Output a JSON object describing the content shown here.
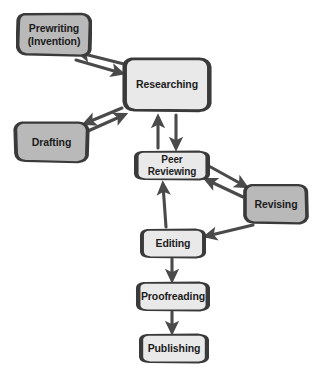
{
  "diagram": {
    "style": "hand-drawn flowchart",
    "colors": {
      "background": "#ffffff",
      "node_fill_dark": "#b9b9b9",
      "node_fill_light": "#e9e9e9",
      "node_stroke": "#3a3a3a",
      "edge_stroke": "#4a4a4a",
      "text": "#1c1c1c"
    },
    "nodes": [
      {
        "id": "prewriting",
        "label": "Prewriting\n(Invention)",
        "shade": "dark",
        "x": 16,
        "y": 11,
        "w": 76,
        "h": 47,
        "font_size": 10.5
      },
      {
        "id": "researching",
        "label": "Researching",
        "shade": "light",
        "x": 122,
        "y": 56,
        "w": 90,
        "h": 57,
        "font_size": 10.5
      },
      {
        "id": "drafting",
        "label": "Drafting",
        "shade": "dark",
        "x": 13,
        "y": 120,
        "w": 77,
        "h": 44,
        "font_size": 10.5
      },
      {
        "id": "peer-reviewing",
        "label": "Peer Reviewing",
        "shade": "light",
        "x": 134,
        "y": 150,
        "w": 76,
        "h": 31,
        "font_size": 10
      },
      {
        "id": "revising",
        "label": "Revising",
        "shade": "dark",
        "x": 243,
        "y": 183,
        "w": 66,
        "h": 42,
        "font_size": 10.5
      },
      {
        "id": "editing",
        "label": "Editing",
        "shade": "light",
        "x": 140,
        "y": 228,
        "w": 66,
        "h": 31,
        "font_size": 10.5
      },
      {
        "id": "proofreading",
        "label": "Proofreading",
        "shade": "light",
        "x": 136,
        "y": 281,
        "w": 74,
        "h": 31,
        "font_size": 10.5
      },
      {
        "id": "publishing",
        "label": "Publishing",
        "shade": "light",
        "x": 139,
        "y": 333,
        "w": 70,
        "h": 31,
        "font_size": 10.5
      }
    ],
    "edges": [
      {
        "id": "researching-to-prewriting",
        "from": "researching",
        "to": "prewriting",
        "direction": "one-way"
      },
      {
        "id": "prewriting-to-researching",
        "from": "prewriting",
        "to": "researching",
        "direction": "one-way"
      },
      {
        "id": "researching-to-drafting",
        "from": "researching",
        "to": "drafting",
        "direction": "one-way"
      },
      {
        "id": "drafting-to-researching",
        "from": "drafting",
        "to": "researching",
        "direction": "one-way"
      },
      {
        "id": "researching-to-peer-reviewing",
        "from": "researching",
        "to": "peer-reviewing",
        "direction": "one-way"
      },
      {
        "id": "peer-reviewing-to-researching",
        "from": "peer-reviewing",
        "to": "researching",
        "direction": "one-way"
      },
      {
        "id": "peer-reviewing-to-revising",
        "from": "peer-reviewing",
        "to": "revising",
        "direction": "one-way"
      },
      {
        "id": "revising-to-peer-reviewing",
        "from": "revising",
        "to": "peer-reviewing",
        "direction": "one-way"
      },
      {
        "id": "revising-to-editing",
        "from": "revising",
        "to": "editing",
        "direction": "one-way"
      },
      {
        "id": "editing-to-peer-reviewing",
        "from": "editing",
        "to": "peer-reviewing",
        "direction": "one-way"
      },
      {
        "id": "editing-to-proofreading",
        "from": "editing",
        "to": "proofreading",
        "direction": "one-way"
      },
      {
        "id": "proofreading-to-publishing",
        "from": "proofreading",
        "to": "publishing",
        "direction": "one-way"
      }
    ]
  }
}
